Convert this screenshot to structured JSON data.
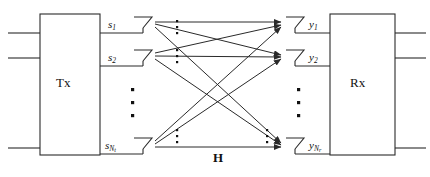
{
  "diagram": {
    "type": "block-diagram",
    "stroke_color": "#2a2a2a",
    "background": "#ffffff",
    "transmitter": {
      "label": "Tx",
      "box": {
        "x": 40,
        "y": 14,
        "w": 60,
        "h": 141
      },
      "input_lines": 3,
      "antennas": [
        {
          "id": "tx1",
          "label_base": "s",
          "label_sub": "1",
          "y": 24
        },
        {
          "id": "tx2",
          "label_base": "s",
          "label_sub": "2",
          "y": 57
        },
        {
          "id": "txN",
          "label_base": "s",
          "label_sub": "N",
          "label_sub2": "t",
          "y": 145
        }
      ],
      "vertical_ellipsis": true
    },
    "receiver": {
      "label": "Rx",
      "box": {
        "x": 330,
        "y": 14,
        "w": 65,
        "h": 141
      },
      "output_lines": 3,
      "antennas": [
        {
          "id": "rx1",
          "label_base": "y",
          "label_sub": "1",
          "y": 24
        },
        {
          "id": "rx2",
          "label_base": "y",
          "label_sub": "2",
          "y": 57
        },
        {
          "id": "rxN",
          "label_base": "y",
          "label_sub": "N",
          "label_sub2": "r",
          "y": 145
        }
      ],
      "vertical_ellipsis": true
    },
    "channel": {
      "label": "H",
      "label_style": "bold",
      "paths": 9,
      "ellipsis_columns": 4
    }
  }
}
